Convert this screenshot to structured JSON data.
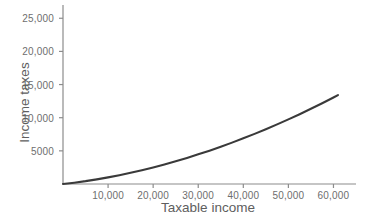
{
  "chart_data": {
    "type": "line",
    "title": "",
    "xlabel": "Taxable income",
    "ylabel": "Income taxes",
    "xlim": [
      0,
      65000
    ],
    "ylim": [
      0,
      27000
    ],
    "grid": false,
    "legend": null,
    "xticks": [
      10000,
      20000,
      30000,
      40000,
      50000,
      60000
    ],
    "xtick_labels": [
      "10,000",
      "20,000",
      "30,000",
      "40,000",
      "50,000",
      "60,000"
    ],
    "yticks": [
      5000,
      10000,
      15000,
      20000,
      25000
    ],
    "ytick_labels": [
      "5000",
      "10,000",
      "15,000",
      "20,000",
      "25,000"
    ],
    "series": [
      {
        "name": "Income taxes",
        "color": "#3a3a3a",
        "x": [
          0,
          2500,
          5000,
          7500,
          10000,
          12500,
          15000,
          17500,
          20000,
          22500,
          25000,
          27500,
          30000,
          32500,
          35000,
          37500,
          40000,
          42500,
          45000,
          47500,
          50000,
          52500,
          55000,
          57500,
          60000,
          61000
        ],
        "y": [
          0,
          200,
          430,
          700,
          1000,
          1330,
          1690,
          2080,
          2500,
          2950,
          3430,
          3930,
          4470,
          5030,
          5620,
          6240,
          6890,
          7560,
          8260,
          8990,
          9750,
          10530,
          11340,
          12180,
          13050,
          13410
        ]
      }
    ],
    "axis_color": "#8c8c8c",
    "tick_color": "#8c8c8c",
    "label_color": "#5e5e5e",
    "background": "#ffffff"
  },
  "geometry": {
    "origin_x": 63,
    "origin_y": 184,
    "axis_top_y": 5,
    "axis_right_x": 356,
    "px_per_10000_x": 46,
    "px_per_5000_y": 32,
    "curve_end_x": 345,
    "curve_end_y": 52
  }
}
